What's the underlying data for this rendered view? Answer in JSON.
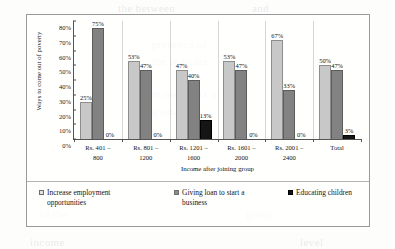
{
  "chart_data": {
    "type": "bar",
    "title": "",
    "subtitle": "",
    "xlabel": "Income after joining group",
    "ylabel": "Ways to come out of poverty",
    "ylim": [
      0,
      80
    ],
    "yticks": [
      "80%",
      "70%",
      "60%",
      "50%",
      "40%",
      "30%",
      "20%",
      "10%",
      "0%"
    ],
    "ytick_values": [
      80,
      70,
      60,
      50,
      40,
      30,
      20,
      10,
      0
    ],
    "grid": false,
    "legend_position": "bottom",
    "units": "percent",
    "categories": [
      "Rs. 401 – 800",
      "Rs. 801 – 1200",
      "Rs. 1201 – 1600",
      "Rs. 1601 – 2000",
      "Rs. 2001 – 2400",
      "Total"
    ],
    "category_lines": [
      [
        "Rs. 401 –",
        "800"
      ],
      [
        "Rs. 801 –",
        "1200"
      ],
      [
        "Rs. 1201 –",
        "1600"
      ],
      [
        "Rs. 1601 –",
        "2000"
      ],
      [
        "Rs. 2001 –",
        "2400"
      ],
      [
        "Total",
        ""
      ]
    ],
    "series": [
      {
        "name": "Increase employment opportunities",
        "name_lines": [
          "Increase employment",
          "opportunities"
        ],
        "color": "#c8c8c8",
        "values": [
          25,
          53,
          47,
          53,
          67,
          50
        ],
        "labels": [
          "25%",
          "53%",
          "47%",
          "53%",
          "67%",
          "50%"
        ]
      },
      {
        "name": "Giving loan to start a business",
        "name_lines": [
          "Giving loan to start a",
          "business"
        ],
        "color": "#828282",
        "values": [
          75,
          47,
          40,
          47,
          33,
          47
        ],
        "labels": [
          "75%",
          "47%",
          "40%",
          "47%",
          "33%",
          "47%"
        ]
      },
      {
        "name": "Educating children",
        "name_lines": [
          "Educating children",
          ""
        ],
        "color": "#151515",
        "values": [
          0,
          0,
          13,
          0,
          0,
          3
        ],
        "labels": [
          "0%",
          "0%",
          "13%",
          "0%",
          "0%",
          "3%"
        ]
      }
    ]
  },
  "colors": {
    "series_1": "#c8c8c8",
    "series_2": "#828282",
    "series_3": "#151515",
    "axis": "#555555",
    "frame": "#9a9a9a",
    "page": "#fdfdfc"
  }
}
